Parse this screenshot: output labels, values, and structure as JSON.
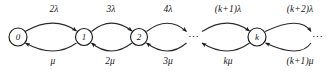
{
  "diagram": {
    "type": "state-transition-diagram",
    "subtype": "birth-death-markov-chain",
    "stroke_color": "#2a2a2a",
    "node_fill": "#ffffff",
    "text_color": "#171717",
    "background": "#ffffff",
    "nodes": [
      {
        "id": "s0",
        "label": "0",
        "x": 18,
        "y": 37,
        "r": 9,
        "shape": "circle"
      },
      {
        "id": "s1",
        "label": "1",
        "x": 84,
        "y": 37,
        "r": 8.5,
        "shape": "circle"
      },
      {
        "id": "s2",
        "label": "2",
        "x": 139,
        "y": 37,
        "r": 8.5,
        "shape": "circle"
      },
      {
        "id": "e1",
        "label": "⋯",
        "x": 194,
        "y": 37,
        "r": 0,
        "shape": "ellipsis"
      },
      {
        "id": "sk",
        "label": "k",
        "x": 257,
        "y": 37,
        "r": 9,
        "shape": "circle"
      },
      {
        "id": "e2",
        "label": "⋯",
        "x": 318,
        "y": 37,
        "r": 0,
        "shape": "ellipsis"
      }
    ],
    "forward_labels": [
      {
        "id": "f0",
        "text": "2λ",
        "x": 54,
        "y": 10
      },
      {
        "id": "f1",
        "text": "3λ",
        "x": 111,
        "y": 10
      },
      {
        "id": "f2",
        "text": "4λ",
        "x": 168,
        "y": 10
      },
      {
        "id": "f3",
        "text": "(k+1)λ",
        "x": 228,
        "y": 10
      },
      {
        "id": "f4",
        "text": "(k+2)λ",
        "x": 300,
        "y": 10
      }
    ],
    "backward_labels": [
      {
        "id": "b0",
        "text": "μ",
        "x": 53,
        "y": 62
      },
      {
        "id": "b1",
        "text": "2μ",
        "x": 110,
        "y": 62
      },
      {
        "id": "b2",
        "text": "3μ",
        "x": 168,
        "y": 62
      },
      {
        "id": "b3",
        "text": "kμ",
        "x": 228,
        "y": 62
      },
      {
        "id": "b4",
        "text": "(k+1)μ",
        "x": 300,
        "y": 62
      }
    ]
  }
}
